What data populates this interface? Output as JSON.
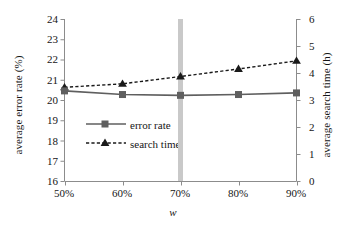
{
  "chart_data": {
    "type": "line",
    "title": "",
    "xlabel": "w",
    "categories": [
      "50%",
      "60%",
      "70%",
      "80%",
      "90%"
    ],
    "x_values": [
      50,
      60,
      70,
      80,
      90
    ],
    "grid": false,
    "legend_position": "center-left",
    "highlight": {
      "category": "70%",
      "color": "#c9c9c9",
      "note": "vertical grey band at w = 70%"
    },
    "axes": {
      "left": {
        "label": "average error rate (%)",
        "ylim": [
          16,
          24
        ],
        "ticks": [
          16,
          17,
          18,
          19,
          20,
          21,
          22,
          23,
          24
        ],
        "tick_labels": [
          "16",
          "17",
          "18",
          "19",
          "20",
          "21",
          "22",
          "23",
          "24"
        ]
      },
      "right": {
        "label": "average search time (h)",
        "ylim": [
          0,
          6
        ],
        "ticks": [
          0,
          1,
          2,
          3,
          4,
          5,
          6
        ],
        "tick_labels": [
          "0",
          "1",
          "2",
          "3",
          "4",
          "5",
          "6"
        ]
      }
    },
    "series": [
      {
        "name": "error rate",
        "axis": "left",
        "marker": "square",
        "line_style": "solid",
        "color": "#5f5f5f",
        "values": [
          20.45,
          20.27,
          20.23,
          20.27,
          20.35
        ]
      },
      {
        "name": "search time",
        "axis": "right",
        "marker": "triangle",
        "line_style": "dashed",
        "color": "#1a1a1a",
        "values": [
          3.47,
          3.6,
          3.87,
          4.15,
          4.45
        ]
      }
    ]
  },
  "legend": {
    "items": [
      {
        "label": "error rate"
      },
      {
        "label": "search time"
      }
    ]
  }
}
